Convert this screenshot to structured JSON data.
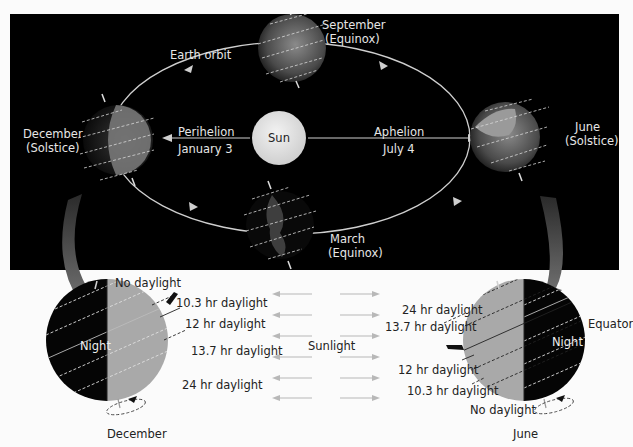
{
  "colors": {
    "panel_bg": "#000000",
    "page_bg": "#fbfbfb",
    "sun": "#e8e8e8",
    "orbit_line": "#cfcfcf",
    "day_side": "#a9a9a9",
    "night_side": "#050505",
    "curved_arrow": "#6e6e6e",
    "sunlight_arrow": "#b8b8b8",
    "label_light": "#e6e6e6",
    "label_dark": "#222222"
  },
  "orbit_panel": {
    "sun_label": "Sun",
    "earth_orbit_label": "Earth orbit",
    "perihelion": {
      "label": "Perihelion",
      "date": "January 3"
    },
    "aphelion": {
      "label": "Aphelion",
      "date": "July 4"
    },
    "positions": {
      "september": {
        "month": "September",
        "type": "(Equinox)"
      },
      "december": {
        "month": "December",
        "type": "(Solstice)"
      },
      "march": {
        "month": "March",
        "type": "(Equinox)"
      },
      "june": {
        "month": "June",
        "type": "(Solstice)"
      }
    }
  },
  "december_detail": {
    "caption": "December",
    "night_label": "Night",
    "latitudes": [
      {
        "label": "No daylight"
      },
      {
        "label": "10.3 hr daylight"
      },
      {
        "label": "12 hr daylight"
      },
      {
        "label": "13.7 hr daylight"
      },
      {
        "label": "24 hr daylight"
      }
    ]
  },
  "june_detail": {
    "caption": "June",
    "night_label": "Night",
    "equator_label": "Equator",
    "latitudes": [
      {
        "label": "24 hr daylight"
      },
      {
        "label": "13.7 hr daylight"
      },
      {
        "label": "12 hr daylight"
      },
      {
        "label": "10.3 hr daylight"
      },
      {
        "label": "No daylight"
      }
    ]
  },
  "sunlight": {
    "label": "Sunlight",
    "arrow_count_each_side": 6
  }
}
